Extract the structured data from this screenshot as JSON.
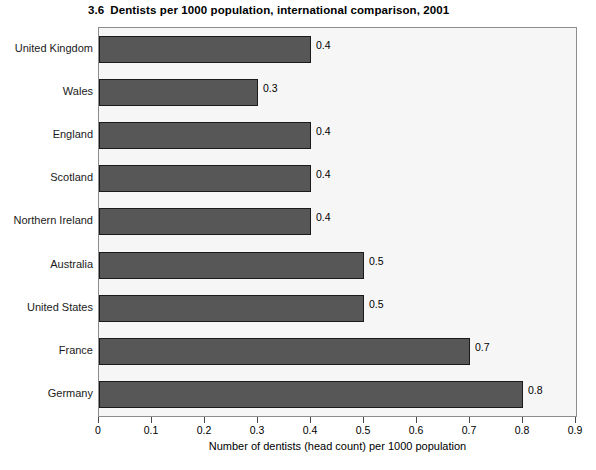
{
  "chart_data": {
    "type": "bar",
    "orientation": "horizontal",
    "title_number": "3.6",
    "title": "Dentists per 1000 population, international comparison, 2001",
    "categories": [
      "United Kingdom",
      "Wales",
      "England",
      "Scotland",
      "Northern Ireland",
      "Australia",
      "United States",
      "France",
      "Germany"
    ],
    "values": [
      0.4,
      0.3,
      0.4,
      0.4,
      0.4,
      0.5,
      0.5,
      0.7,
      0.8
    ],
    "value_labels": [
      "0.4",
      "0.3",
      "0.4",
      "0.4",
      "0.4",
      "0.5",
      "0.5",
      "0.7",
      "0.8"
    ],
    "xlabel": "Number of dentists (head count) per 1000 population",
    "ylabel": "",
    "xlim": [
      0,
      0.9
    ],
    "xticks": [
      0,
      0.1,
      0.2,
      0.3,
      0.4,
      0.5,
      0.6,
      0.7,
      0.8,
      0.9
    ],
    "xtick_labels": [
      "0",
      "0.1",
      "0.2",
      "0.3",
      "0.4",
      "0.5",
      "0.6",
      "0.7",
      "0.8",
      "0.9"
    ],
    "grid": false,
    "legend": null,
    "colors": {
      "bar_fill": "#575757",
      "bar_border": "#1a1a1a",
      "plot_background": "#f6f6f6",
      "plot_border": "#8d8d8d",
      "page_background": "#ffffff",
      "text": "#000000"
    }
  }
}
